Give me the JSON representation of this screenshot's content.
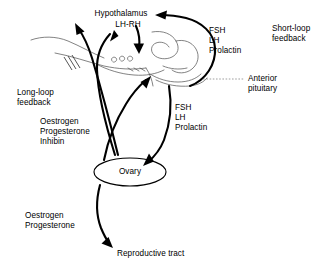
{
  "diagram": {
    "background_color": "#ffffff",
    "line_color": "#000000",
    "sketch_color": "#5a5a5a",
    "width": 331,
    "height": 268,
    "nodes": {
      "hypothalamus": "Hypothalamus",
      "lh_rh": "LH-RH",
      "anterior_pituitary": "Anterior\npituitary",
      "anterior_pituitary_line1": "Anterior",
      "anterior_pituitary_line2": "pituitary",
      "ovary": "Ovary",
      "reproductive_tract": "Reproductive tract"
    },
    "labels": {
      "short_loop_feedback_line1": "Short-loop",
      "short_loop_feedback_line2": "feedback",
      "long_loop_feedback_line1": "Long-loop",
      "long_loop_feedback_line2": "feedback",
      "pituitary_hormones_upper": {
        "line1": "FSH",
        "line2": "LH",
        "line3": "Prolactin"
      },
      "pituitary_hormones_lower": {
        "line1": "FSH",
        "line2": "LH",
        "line3": "Prolactin"
      },
      "ovarian_hormones_feedback": {
        "line1": "Oestrogen",
        "line2": "Progesterone",
        "line3": "Inhibin"
      },
      "ovarian_hormones_tract": {
        "line1": "Oestrogen",
        "line2": "Progesterone"
      }
    }
  }
}
